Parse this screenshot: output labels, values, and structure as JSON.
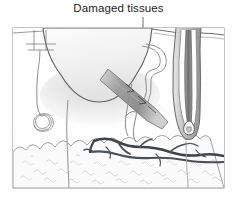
{
  "figure": {
    "title": "Damaged tissues",
    "type": "anatomical-cross-section",
    "frame": {
      "x": 13,
      "y": 28,
      "width": 211,
      "height": 160
    },
    "annotation": {
      "text": "Damaged tissues",
      "leader_line": {
        "x1": 143,
        "y1": 18,
        "x2": 143,
        "y2": 48
      },
      "arrow_tip": {
        "x": 143,
        "y": 49
      }
    },
    "structures": [
      {
        "name": "wound-crater",
        "label": "Wound crater / ulcer cavity"
      },
      {
        "name": "damaged-tissue-wedge",
        "label": "Damaged tissue wedge"
      },
      {
        "name": "hair-follicle",
        "label": "Hair follicle"
      },
      {
        "name": "hair-shaft",
        "label": "Hair shaft"
      },
      {
        "name": "sweat-gland",
        "label": "Coiled sweat gland"
      },
      {
        "name": "sweat-duct",
        "label": "Sweat duct"
      },
      {
        "name": "blood-vessels",
        "label": "Blood vessels"
      },
      {
        "name": "subcutaneous-fat",
        "label": "Subcutaneous fat"
      },
      {
        "name": "capillary-loop",
        "label": "Capillary loop"
      }
    ],
    "colors": {
      "line": "#6b6b6b",
      "line_dark": "#4a4a4a",
      "vessel": "#5c6268",
      "vessel_dark": "#41464b",
      "tissue_light": "#f2f2f2",
      "tissue_mid": "#dcdcdc",
      "tissue_shadow": "#b9b9b9",
      "fat_fill": "#fafafa",
      "frame_stroke": "#8a8a8a",
      "background": "#ffffff",
      "text": "#1b1b1b"
    }
  }
}
